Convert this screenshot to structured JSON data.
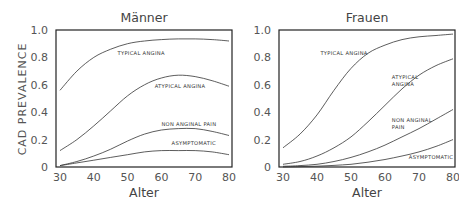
{
  "figure": {
    "ylabel": "CAD PREVALENCE",
    "xlabel": "Alter"
  },
  "chart_data": [
    {
      "type": "line",
      "title": "Männer",
      "xlabel": "Alter",
      "ylabel": "CAD PREVALENCE",
      "xlim": [
        30,
        80
      ],
      "ylim": [
        0,
        1.0
      ],
      "xticks": [
        30,
        40,
        50,
        60,
        70,
        80
      ],
      "yticks": [
        "0",
        "0.2",
        "0.4",
        "0.6",
        "0.8",
        "1.0"
      ],
      "grid": false,
      "legend": "inline labels",
      "x": [
        30,
        35,
        40,
        45,
        50,
        55,
        60,
        65,
        70,
        75,
        80
      ],
      "series": [
        {
          "name": "TYPICAL ANGINA",
          "values": [
            0.56,
            0.7,
            0.8,
            0.86,
            0.9,
            0.92,
            0.93,
            0.935,
            0.935,
            0.93,
            0.92
          ]
        },
        {
          "name": "ATYPICAL ANGINA",
          "values": [
            0.12,
            0.2,
            0.3,
            0.41,
            0.52,
            0.6,
            0.65,
            0.67,
            0.66,
            0.63,
            0.59
          ]
        },
        {
          "name": "NON ANGINAL PAIN",
          "values": [
            0.01,
            0.04,
            0.08,
            0.13,
            0.19,
            0.24,
            0.27,
            0.28,
            0.28,
            0.26,
            0.23
          ]
        },
        {
          "name": "ASYMPTOMATIC",
          "values": [
            0.01,
            0.03,
            0.05,
            0.07,
            0.09,
            0.11,
            0.12,
            0.12,
            0.12,
            0.11,
            0.09
          ]
        }
      ],
      "label_positions": [
        {
          "text": "TYPICAL ANGINA",
          "x": 47,
          "y": 0.82
        },
        {
          "text": "ATYPICAL ANGINA",
          "x": 58,
          "y": 0.58
        },
        {
          "text": "NON ANGINAL PAIN",
          "x": 60,
          "y": 0.3
        },
        {
          "text": "ASYMPTOMATIC",
          "x": 63,
          "y": 0.16
        }
      ]
    },
    {
      "type": "line",
      "title": "Frauen",
      "xlabel": "Alter",
      "ylabel": "",
      "xlim": [
        30,
        80
      ],
      "ylim": [
        0,
        1.0
      ],
      "xticks": [
        30,
        40,
        50,
        60,
        70,
        80
      ],
      "yticks": [
        "0",
        "0.2",
        "0.4",
        "0.6",
        "0.8",
        "1.0"
      ],
      "grid": false,
      "legend": "inline labels",
      "x": [
        30,
        35,
        40,
        45,
        50,
        55,
        60,
        65,
        70,
        75,
        80
      ],
      "series": [
        {
          "name": "TYPICAL ANGINA",
          "values": [
            0.14,
            0.24,
            0.38,
            0.56,
            0.72,
            0.83,
            0.89,
            0.93,
            0.95,
            0.96,
            0.97
          ]
        },
        {
          "name": "ATYPICAL ANGINA",
          "values": [
            0.02,
            0.04,
            0.08,
            0.14,
            0.22,
            0.33,
            0.45,
            0.57,
            0.67,
            0.74,
            0.79
          ]
        },
        {
          "name": "NON ANGINAL PAIN",
          "values": [
            0.005,
            0.01,
            0.02,
            0.04,
            0.07,
            0.11,
            0.16,
            0.22,
            0.28,
            0.35,
            0.42
          ]
        },
        {
          "name": "ASYMPTOMATIC",
          "values": [
            0.0,
            0.003,
            0.006,
            0.012,
            0.02,
            0.035,
            0.055,
            0.08,
            0.11,
            0.15,
            0.2
          ]
        }
      ],
      "label_positions": [
        {
          "text": "TYPICAL ANGINA",
          "x": 41,
          "y": 0.82
        },
        {
          "text": "ATYPICAL",
          "x": 62,
          "y": 0.64
        },
        {
          "text": "ANGINA",
          "x": 62,
          "y": 0.59
        },
        {
          "text": "NON ANGINAL",
          "x": 62,
          "y": 0.33
        },
        {
          "text": "PAIN",
          "x": 62,
          "y": 0.28
        },
        {
          "text": "ASYMPTOMATIC",
          "x": 67,
          "y": 0.06
        }
      ]
    }
  ]
}
